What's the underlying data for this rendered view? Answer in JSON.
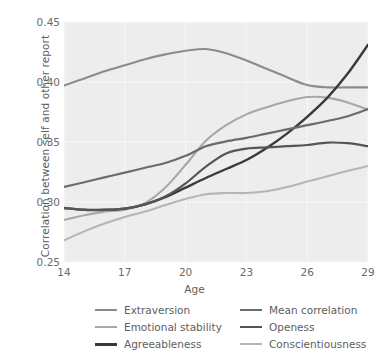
{
  "chart_data": {
    "type": "line",
    "title": "",
    "xlabel": "Age",
    "ylabel": "Correlation between self and other report",
    "xlim": [
      14,
      29
    ],
    "ylim": [
      0.25,
      0.45
    ],
    "xticks": [
      "14",
      "17",
      "20",
      "23",
      "26",
      "29"
    ],
    "yticks": [
      "0.45",
      "0.40",
      "0.35",
      "0.30",
      "0.25"
    ],
    "grid": true,
    "legend_position": "below-center",
    "x": [
      14,
      15,
      16,
      17,
      18,
      19,
      20,
      21,
      22,
      23,
      24,
      25,
      26,
      27,
      28,
      29
    ],
    "series": [
      {
        "name": "Extraversion",
        "color": "#8c8c8c",
        "width": 2.1,
        "values": [
          0.397,
          0.403,
          0.409,
          0.414,
          0.419,
          0.423,
          0.426,
          0.4275,
          0.424,
          0.418,
          0.411,
          0.404,
          0.3975,
          0.3955,
          0.3955,
          0.3955
        ]
      },
      {
        "name": "Emotional stability",
        "color": "#a8a8a8",
        "width": 2.1,
        "values": [
          0.285,
          0.289,
          0.292,
          0.2935,
          0.299,
          0.312,
          0.331,
          0.351,
          0.364,
          0.373,
          0.379,
          0.384,
          0.3875,
          0.387,
          0.383,
          0.377
        ]
      },
      {
        "name": "Agreeableness",
        "color": "#3a3a3a",
        "width": 2.4,
        "values": [
          0.295,
          0.2935,
          0.2935,
          0.2945,
          0.298,
          0.304,
          0.312,
          0.32,
          0.3275,
          0.335,
          0.345,
          0.357,
          0.371,
          0.387,
          0.407,
          0.431
        ]
      },
      {
        "name": "Mean correlation",
        "color": "#6b6b6b",
        "width": 2.2,
        "values": [
          0.3125,
          0.3165,
          0.3205,
          0.3245,
          0.3285,
          0.3325,
          0.3385,
          0.3465,
          0.3505,
          0.3535,
          0.357,
          0.3605,
          0.364,
          0.3675,
          0.3715,
          0.3775
        ]
      },
      {
        "name": "Openess",
        "color": "#555555",
        "width": 2.2,
        "values": [
          0.295,
          0.2935,
          0.2935,
          0.2945,
          0.298,
          0.3045,
          0.3155,
          0.3295,
          0.3405,
          0.3445,
          0.3455,
          0.3465,
          0.3475,
          0.3495,
          0.349,
          0.3465
        ]
      },
      {
        "name": "Conscientiousness",
        "color": "#b5b5b5",
        "width": 2.1,
        "values": [
          0.268,
          0.2755,
          0.282,
          0.2875,
          0.292,
          0.2975,
          0.3025,
          0.3065,
          0.3075,
          0.3075,
          0.309,
          0.3125,
          0.317,
          0.3215,
          0.326,
          0.33
        ]
      }
    ]
  },
  "legend": {
    "items": [
      {
        "label": "Extraversion",
        "color": "#8c8c8c",
        "width": 2.1,
        "col": 0,
        "row": 0
      },
      {
        "label": "Emotional stability",
        "color": "#a8a8a8",
        "width": 2.1,
        "col": 0,
        "row": 1
      },
      {
        "label": "Agreeableness",
        "color": "#3a3a3a",
        "width": 3.0,
        "col": 0,
        "row": 2
      },
      {
        "label": "Mean correlation",
        "color": "#6b6b6b",
        "width": 2.6,
        "col": 1,
        "row": 0
      },
      {
        "label": "Openess",
        "color": "#555555",
        "width": 2.6,
        "col": 1,
        "row": 1
      },
      {
        "label": "Conscientiousness",
        "color": "#b5b5b5",
        "width": 2.1,
        "col": 1,
        "row": 2
      }
    ]
  },
  "style": {
    "plot_background": "#ededed",
    "grid_color": "#f7f7f7",
    "figure_background": "#ffffff",
    "tick_color": "#6a6a6a"
  }
}
